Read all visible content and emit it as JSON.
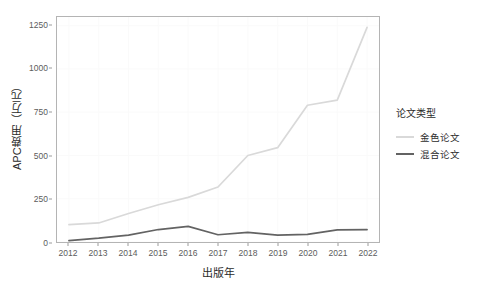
{
  "chart_data": {
    "type": "line",
    "title": "",
    "xlabel": "出版年",
    "ylabel": "APC费用（万元）",
    "x": [
      2012,
      2013,
      2014,
      2015,
      2016,
      2017,
      2018,
      2019,
      2020,
      2021,
      2022
    ],
    "xticklabels": [
      "2012",
      "2013",
      "2014",
      "2015",
      "2016",
      "2017",
      "2018",
      "2019",
      "2020",
      "2021",
      "2022"
    ],
    "yticks": [
      0,
      250,
      500,
      750,
      1000,
      1250
    ],
    "yticklabels": [
      "0",
      "250",
      "500",
      "750",
      "1000",
      "1250"
    ],
    "ylim": [
      0,
      1300
    ],
    "xlim": [
      2011.6,
      2022.4
    ],
    "grid": true,
    "legend_position": "right",
    "legend_title": "论文类型",
    "series": [
      {
        "name": "金色论文",
        "color": "#d9d9d9",
        "values": [
          100,
          110,
          165,
          215,
          258,
          318,
          500,
          545,
          790,
          820,
          1240
        ]
      },
      {
        "name": "混合论文",
        "color": "#636363",
        "values": [
          8,
          22,
          40,
          72,
          90,
          42,
          56,
          40,
          44,
          70,
          72
        ]
      }
    ]
  },
  "legend": {
    "title": "论文类型",
    "items": [
      {
        "label": "金色论文",
        "color": "#d9d9d9"
      },
      {
        "label": "混合论文",
        "color": "#636363"
      }
    ]
  },
  "axes": {
    "x_title": "出版年",
    "y_title": "APC费用（万元）"
  },
  "colors": {
    "panel_border": "#b4b4b4",
    "grid": "#fafafa",
    "tick_text": "#5c5c5c",
    "axis_title": "#2b2b2b",
    "background": "#ffffff"
  }
}
